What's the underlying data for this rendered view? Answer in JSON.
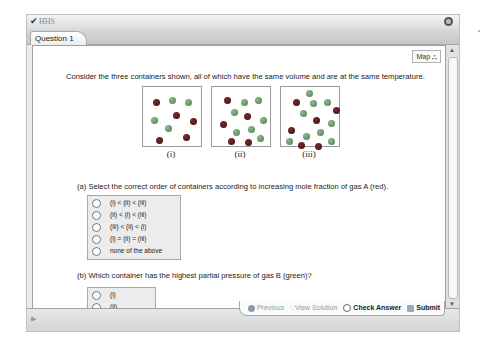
{
  "window": {
    "title": "HHS",
    "tabs": [
      {
        "label": "Question 1",
        "active": true
      }
    ]
  },
  "toolbar": {
    "map_label": "Map"
  },
  "question": {
    "intro": "Consider the three containers shown, all of which have the same volume and are at the same temperature.",
    "containers": [
      {
        "label": "(i)",
        "molecules": [
          {
            "x": 10,
            "y": 12,
            "gas": "A"
          },
          {
            "x": 26,
            "y": 10,
            "gas": "B"
          },
          {
            "x": 42,
            "y": 12,
            "gas": "B"
          },
          {
            "x": 30,
            "y": 25,
            "gas": "A"
          },
          {
            "x": 8,
            "y": 30,
            "gas": "B"
          },
          {
            "x": 47,
            "y": 31,
            "gas": "A"
          },
          {
            "x": 22,
            "y": 38,
            "gas": "B"
          },
          {
            "x": 13,
            "y": 50,
            "gas": "A"
          },
          {
            "x": 40,
            "y": 47,
            "gas": "A"
          }
        ]
      },
      {
        "label": "(ii)",
        "molecules": [
          {
            "x": 12,
            "y": 10,
            "gas": "A"
          },
          {
            "x": 29,
            "y": 12,
            "gas": "B"
          },
          {
            "x": 43,
            "y": 10,
            "gas": "B"
          },
          {
            "x": 19,
            "y": 22,
            "gas": "B"
          },
          {
            "x": 32,
            "y": 26,
            "gas": "A"
          },
          {
            "x": 48,
            "y": 30,
            "gas": "B"
          },
          {
            "x": 8,
            "y": 34,
            "gas": "A"
          },
          {
            "x": 21,
            "y": 42,
            "gas": "B"
          },
          {
            "x": 36,
            "y": 39,
            "gas": "B"
          },
          {
            "x": 16,
            "y": 51,
            "gas": "A"
          },
          {
            "x": 33,
            "y": 52,
            "gas": "A"
          },
          {
            "x": 45,
            "y": 48,
            "gas": "B"
          }
        ]
      },
      {
        "label": "(iii)",
        "molecules": [
          {
            "x": 25,
            "y": 3,
            "gas": "B"
          },
          {
            "x": 12,
            "y": 12,
            "gas": "A"
          },
          {
            "x": 29,
            "y": 13,
            "gas": "B"
          },
          {
            "x": 43,
            "y": 12,
            "gas": "B"
          },
          {
            "x": 19,
            "y": 23,
            "gas": "B"
          },
          {
            "x": 52,
            "y": 20,
            "gas": "A"
          },
          {
            "x": 32,
            "y": 30,
            "gas": "A"
          },
          {
            "x": 47,
            "y": 33,
            "gas": "B"
          },
          {
            "x": 7,
            "y": 40,
            "gas": "A"
          },
          {
            "x": 22,
            "y": 46,
            "gas": "B"
          },
          {
            "x": 36,
            "y": 42,
            "gas": "B"
          },
          {
            "x": 5,
            "y": 51,
            "gas": "B"
          },
          {
            "x": 17,
            "y": 55,
            "gas": "A"
          },
          {
            "x": 34,
            "y": 56,
            "gas": "A"
          },
          {
            "x": 47,
            "y": 51,
            "gas": "B"
          }
        ]
      }
    ],
    "gas_colors": {
      "A": "#5a1c1c",
      "B": "#6f9a6f"
    },
    "part_a": {
      "prompt": "(a) Select the correct order of containers according to increasing mole fraction of gas A (red).",
      "options": [
        "(i) < (ii) < (iii)",
        "(ii) < (i) < (iii)",
        "(iii) < (ii) < (i)",
        "(i) = (ii) = (iii)",
        "none of the above"
      ],
      "selected": null
    },
    "part_b": {
      "prompt": "(b) Which container has the highest partial pressure of gas B (green)?",
      "options": [
        "(i)",
        "(ii)",
        "(iii)"
      ],
      "selected": null
    }
  },
  "footer": {
    "actions": [
      {
        "label": "Previous",
        "enabled": false,
        "icon": "previous-icon"
      },
      {
        "label": "View Solution",
        "enabled": false,
        "icon": "lightbulb-icon"
      },
      {
        "label": "Check Answer",
        "enabled": true,
        "icon": "check-icon"
      },
      {
        "label": "Submit",
        "enabled": true,
        "icon": "submit-icon"
      }
    ]
  }
}
